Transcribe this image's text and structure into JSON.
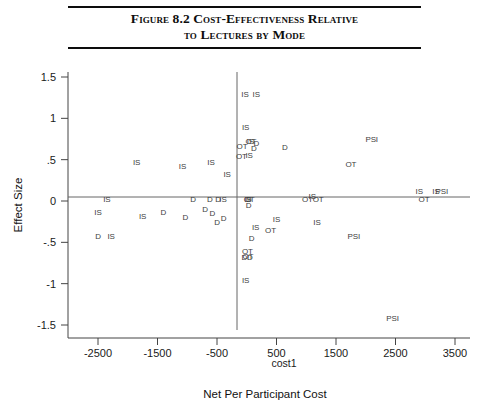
{
  "figure": {
    "title_line_1": "Figure 8.2  Cost-Effectiveness Relative",
    "title_line_2": "to Lectures by Mode",
    "rule_color": "#0d0d0d"
  },
  "chart_data": {
    "type": "scatter",
    "title": "Figure 8.2  Cost-Effectiveness Relative to Lectures by Mode",
    "xlabel": "Net Per Participant Cost",
    "xlabel_secondary": "cost1",
    "ylabel": "Effect Size",
    "xlim": [
      -2900,
      3650
    ],
    "ylim": [
      -1.62,
      1.62
    ],
    "grid": false,
    "legend": "none",
    "marker_style": "text-label",
    "reference_lines": [
      {
        "name": "horizontal-zero-line",
        "axis": "y",
        "value": 0
      },
      {
        "name": "vertical-zero-line",
        "axis": "x",
        "value": 0
      }
    ],
    "xticks": [
      -2500,
      -1500,
      -500,
      500,
      1500,
      2500,
      3500
    ],
    "xtick_labels": [
      "-2500",
      "-1500",
      "-500",
      "500",
      "1500",
      "2500",
      "3500"
    ],
    "yticks": [
      1.5,
      1,
      0.5,
      0,
      -0.5,
      -1,
      -1.5
    ],
    "ytick_labels": [
      "1.5",
      "1",
      ".5",
      "0",
      "-.5",
      "-1",
      "-1.5"
    ],
    "series": [
      {
        "name": "IS",
        "label": "IS",
        "points": [
          {
            "x": -30,
            "y": 1.3
          },
          {
            "x": 160,
            "y": 1.3
          },
          {
            "x": -20,
            "y": 0.9
          },
          {
            "x": 60,
            "y": 0.72
          },
          {
            "x": 40,
            "y": 0.56
          },
          {
            "x": -1850,
            "y": 0.47
          },
          {
            "x": -1080,
            "y": 0.42
          },
          {
            "x": -600,
            "y": 0.47
          },
          {
            "x": -330,
            "y": 0.33
          },
          {
            "x": -2350,
            "y": 0.02
          },
          {
            "x": -400,
            "y": 0.02
          },
          {
            "x": 20,
            "y": 0.02
          },
          {
            "x": 1100,
            "y": 0.06
          },
          {
            "x": 2900,
            "y": 0.12
          },
          {
            "x": 3180,
            "y": 0.12
          },
          {
            "x": -2500,
            "y": -0.13
          },
          {
            "x": -1750,
            "y": -0.18
          },
          {
            "x": -2280,
            "y": -0.42
          },
          {
            "x": 1180,
            "y": -0.25
          },
          {
            "x": 500,
            "y": -0.22
          },
          {
            "x": 150,
            "y": -0.32
          },
          {
            "x": -20,
            "y": -0.95
          }
        ]
      },
      {
        "name": "D",
        "label": "D",
        "points": [
          {
            "x": 160,
            "y": 0.7
          },
          {
            "x": 120,
            "y": 0.64
          },
          {
            "x": 640,
            "y": 0.65
          },
          {
            "x": -900,
            "y": 0.02
          },
          {
            "x": -620,
            "y": 0.02
          },
          {
            "x": -480,
            "y": 0.02
          },
          {
            "x": 30,
            "y": 0.02
          },
          {
            "x": -1400,
            "y": -0.13
          },
          {
            "x": -700,
            "y": -0.1
          },
          {
            "x": -2500,
            "y": -0.42
          },
          {
            "x": -1030,
            "y": -0.19
          },
          {
            "x": -580,
            "y": -0.15
          },
          {
            "x": -500,
            "y": -0.25
          },
          {
            "x": -390,
            "y": -0.2
          },
          {
            "x": 30,
            "y": -0.05
          },
          {
            "x": 80,
            "y": -0.45
          },
          {
            "x": -40,
            "y": -0.68
          },
          {
            "x": 50,
            "y": -0.68
          }
        ]
      },
      {
        "name": "OT",
        "label": "OT",
        "points": [
          {
            "x": 70,
            "y": 0.73
          },
          {
            "x": -80,
            "y": 0.66
          },
          {
            "x": -90,
            "y": 0.55
          },
          {
            "x": 40,
            "y": 0.02
          },
          {
            "x": 1020,
            "y": 0.02
          },
          {
            "x": 1200,
            "y": 0.02
          },
          {
            "x": 1750,
            "y": 0.45
          },
          {
            "x": 2980,
            "y": 0.02
          },
          {
            "x": 400,
            "y": -0.35
          },
          {
            "x": 10,
            "y": -0.6
          },
          {
            "x": 20,
            "y": -0.66
          }
        ]
      },
      {
        "name": "PSI",
        "label": "PSI",
        "points": [
          {
            "x": 2100,
            "y": 0.75
          },
          {
            "x": 3280,
            "y": 0.12
          },
          {
            "x": 1800,
            "y": -0.42
          },
          {
            "x": 2450,
            "y": -1.42
          }
        ]
      }
    ]
  }
}
